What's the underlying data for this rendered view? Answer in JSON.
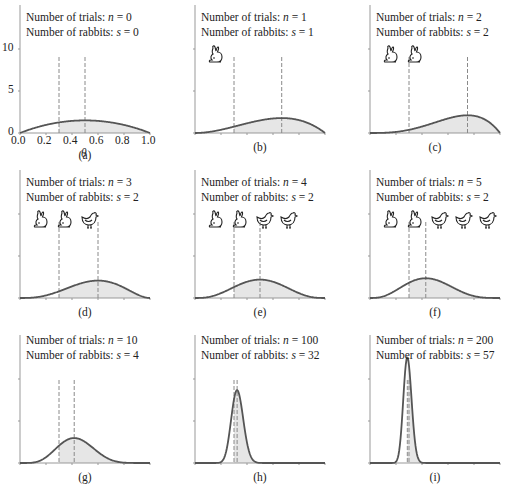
{
  "chart_data": [
    {
      "panel": "a",
      "caption": "(a)",
      "type": "area",
      "n": 0,
      "s": 0,
      "icons": [],
      "true_theta": 0.3,
      "mode": 0.5,
      "peak": 1.5
    },
    {
      "panel": "b",
      "caption": "(b)",
      "type": "area",
      "n": 1,
      "s": 1,
      "icons": [
        "rabbit"
      ],
      "true_theta": 0.3,
      "mode": 0.667,
      "peak": 1.78
    },
    {
      "panel": "c",
      "caption": "(c)",
      "type": "area",
      "n": 2,
      "s": 2,
      "icons": [
        "rabbit",
        "rabbit"
      ],
      "true_theta": 0.3,
      "mode": 0.75,
      "peak": 2.11
    },
    {
      "panel": "d",
      "caption": "(d)",
      "type": "area",
      "n": 3,
      "s": 2,
      "icons": [
        "rabbit",
        "rabbit",
        "chicken"
      ],
      "true_theta": 0.3,
      "mode": 0.6,
      "peak": 2.07
    },
    {
      "panel": "e",
      "caption": "(e)",
      "type": "area",
      "n": 4,
      "s": 2,
      "icons": [
        "rabbit",
        "rabbit",
        "chicken",
        "chicken"
      ],
      "true_theta": 0.3,
      "mode": 0.5,
      "peak": 2.19
    },
    {
      "panel": "f",
      "caption": "(f)",
      "type": "area",
      "n": 5,
      "s": 2,
      "icons": [
        "rabbit",
        "rabbit",
        "chicken",
        "chicken",
        "chicken"
      ],
      "true_theta": 0.3,
      "mode": 0.429,
      "peak": 2.3
    },
    {
      "panel": "g",
      "caption": "(g)",
      "type": "area",
      "n": 10,
      "s": 4,
      "icons": [],
      "true_theta": 0.3,
      "mode": 0.417,
      "peak": 2.94
    },
    {
      "panel": "h",
      "caption": "(h)",
      "type": "area",
      "n": 100,
      "s": 32,
      "icons": [],
      "true_theta": 0.3,
      "mode": 0.324,
      "peak": 8.6
    },
    {
      "panel": "i",
      "caption": "(i)",
      "type": "area",
      "n": 200,
      "s": 57,
      "icons": [],
      "true_theta": 0.3,
      "mode": 0.287,
      "peak": 12.6
    }
  ],
  "axes": {
    "xlabel": "θ",
    "xticks": [
      "0.0",
      "0.2",
      "0.4",
      "0.6",
      "0.8",
      "1.0"
    ],
    "yticks": [
      "0",
      "5",
      "10"
    ],
    "xlim": [
      0,
      1
    ],
    "ylim": [
      0,
      13
    ]
  },
  "labels": {
    "trials_prefix": "Number of trials: ",
    "rabbits_prefix": "Number of rabbits: ",
    "n_var": "n",
    "s_var": "s",
    "eq": " = "
  },
  "colors": {
    "curve": "#555555",
    "fill": "#e6e6e6",
    "dashed": "#8a8a8a",
    "axis": "#999999"
  }
}
